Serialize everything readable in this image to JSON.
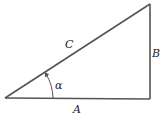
{
  "diagram": {
    "type": "right-triangle",
    "labels": {
      "hypotenuse": "C",
      "vertical_side": "B",
      "base": "A",
      "angle": "α"
    },
    "colors": {
      "stroke": "#555555",
      "text": "#222222",
      "background": "#ffffff"
    }
  }
}
